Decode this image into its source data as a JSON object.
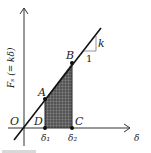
{
  "figure": {
    "y_axis_label": "Fₛ (= kδ)",
    "x_axis_label": "δ",
    "origin_label": "O",
    "points": {
      "A": "A",
      "B": "B",
      "C": "C",
      "D": "D"
    },
    "tick_labels": {
      "delta1": "δ₁",
      "delta2": "δ₂"
    },
    "slope_triangle": {
      "rise_label": "k",
      "run_label": "1"
    },
    "colors": {
      "line": "#1a1a1a",
      "shaded_area": "#555555"
    }
  }
}
